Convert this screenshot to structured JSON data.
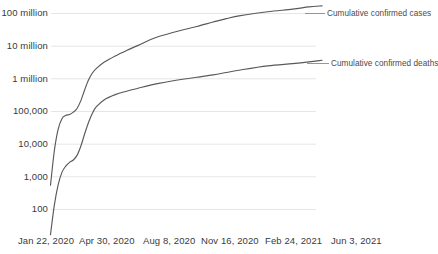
{
  "chart_data": {
    "type": "line",
    "title": "",
    "subtitle": "",
    "xlabel": "",
    "ylabel": "",
    "y_scale": "log",
    "ylim": [
      30,
      200000000
    ],
    "grid": "horizontal",
    "legend_position": "right-inline-at-line-end",
    "y_tick_labels": [
      "100 million",
      "10 million",
      "1 million",
      "100,000",
      "10,000",
      "1,000",
      "100"
    ],
    "y_tick_values": [
      100000000,
      10000000,
      1000000,
      100000,
      10000,
      1000,
      100
    ],
    "x_tick_labels": [
      "Jan 22, 2020",
      "Apr 30, 2020",
      "Aug 8, 2020",
      "Nov 16, 2020",
      "Feb 24, 2021",
      "Jun 3, 2021"
    ],
    "series": [
      {
        "name": "Cumulative confirmed cases",
        "color": "#595959",
        "x": [
          "Jan 22, 2020",
          "Jan 29, 2020",
          "Feb 5, 2020",
          "Feb 12, 2020",
          "Feb 19, 2020",
          "Feb 26, 2020",
          "Mar 4, 2020",
          "Mar 11, 2020",
          "Mar 18, 2020",
          "Mar 25, 2020",
          "Apr 1, 2020",
          "Apr 8, 2020",
          "Apr 15, 2020",
          "Apr 30, 2020",
          "May 20, 2020",
          "Jun 10, 2020",
          "Jul 1, 2020",
          "Jul 22, 2020",
          "Aug 8, 2020",
          "Sep 1, 2020",
          "Sep 24, 2020",
          "Oct 17, 2020",
          "Nov 16, 2020",
          "Dec 10, 2020",
          "Jan 5, 2021",
          "Feb 24, 2021",
          "Apr 10, 2021",
          "May 10, 2021",
          "Jun 3, 2021"
        ],
        "values": [
          555,
          6166,
          28276,
          60328,
          75641,
          81397,
          95333,
          126258,
          219331,
          471035,
          932605,
          1511104,
          2064115,
          3272202,
          5036000,
          7417000,
          10560000,
          15510000,
          19700000,
          25700000,
          32300000,
          39900000,
          54800000,
          69700000,
          86400000,
          112900000,
          135500000,
          158800000,
          171500000
        ],
        "label_text": "Cumulative confirmed cases"
      },
      {
        "name": "Cumulative confirmed deaths",
        "color": "#595959",
        "x": [
          "Jan 22, 2020",
          "Jan 29, 2020",
          "Feb 5, 2020",
          "Feb 12, 2020",
          "Feb 19, 2020",
          "Feb 26, 2020",
          "Mar 4, 2020",
          "Mar 11, 2020",
          "Mar 18, 2020",
          "Mar 25, 2020",
          "Apr 1, 2020",
          "Apr 8, 2020",
          "Apr 15, 2020",
          "Apr 30, 2020",
          "May 20, 2020",
          "Jun 10, 2020",
          "Jul 1, 2020",
          "Jul 22, 2020",
          "Aug 8, 2020",
          "Sep 1, 2020",
          "Sep 24, 2020",
          "Oct 17, 2020",
          "Nov 16, 2020",
          "Dec 10, 2020",
          "Jan 5, 2021",
          "Feb 24, 2021",
          "Apr 10, 2021",
          "May 10, 2021",
          "Jun 3, 2021"
        ],
        "values": [
          17,
          133,
          565,
          1369,
          2122,
          2770,
          3282,
          4615,
          8955,
          21284,
          46809,
          88338,
          137580,
          230000,
          328000,
          418000,
          514000,
          633000,
          726000,
          857000,
          985000,
          1115000,
          1320000,
          1560000,
          1870000,
          2490000,
          2920000,
          3300000,
          3700000
        ],
        "label_text": "Cumulative confirmed deaths"
      }
    ],
    "legend": [
      {
        "label": "Cumulative confirmed cases"
      },
      {
        "label": "Cumulative confirmed deaths"
      }
    ]
  },
  "axis": {
    "y_labels": [
      {
        "text": "100 million",
        "top": 7
      },
      {
        "text": "10 million",
        "top": 40
      },
      {
        "text": "1 million",
        "top": 73
      },
      {
        "text": "100,000",
        "top": 105
      },
      {
        "text": "10,000",
        "top": 138
      },
      {
        "text": "1,000",
        "top": 171
      },
      {
        "text": "100",
        "top": 203
      }
    ],
    "x_labels": [
      {
        "text": "Jan 22, 2020",
        "left": 18
      },
      {
        "text": "Apr 30, 2020",
        "left": 79
      },
      {
        "text": "Aug 8, 2020",
        "left": 143
      },
      {
        "text": "Nov 16, 2020",
        "left": 201
      },
      {
        "text": "Feb 24, 2021",
        "left": 265
      },
      {
        "text": "Jun 3, 2021",
        "left": 331
      }
    ]
  },
  "series_labels": [
    {
      "text": "Cumulative confirmed cases",
      "left": 327,
      "top": 10
    },
    {
      "text": "Cumulative confirmed deaths",
      "left": 331,
      "top": 59
    }
  ],
  "colors": {
    "line": "#595959",
    "gridline": "#e6e6e6",
    "text": "#3a3a3a",
    "label_text": "#4a4a4a",
    "background": "#ffffff"
  }
}
